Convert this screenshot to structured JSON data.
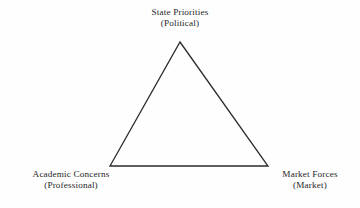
{
  "diagram": {
    "title_present": false,
    "shape": "triangle",
    "stroke_color": "#2b2b2b",
    "background_color": "#fefefe",
    "text_color": "#262626",
    "vertices": [
      {
        "id": "apex",
        "position": "top",
        "x": 180,
        "y": 42,
        "label_primary": "State Priorities",
        "label_secondary": "(Political)"
      },
      {
        "id": "bottom-left",
        "position": "bottom-left",
        "x": 110,
        "y": 166,
        "label_primary": "Academic Concerns",
        "label_secondary": "(Professional)"
      },
      {
        "id": "bottom-right",
        "position": "bottom-right",
        "x": 268,
        "y": 166,
        "label_primary": "Market Forces",
        "label_secondary": "(Market)"
      }
    ]
  }
}
